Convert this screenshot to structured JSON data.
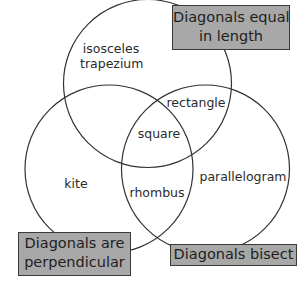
{
  "diagram": {
    "type": "venn",
    "sets": [
      {
        "id": "equal",
        "label_line1": "Diagonals equal",
        "label_line2": "in length",
        "circle": {
          "cx": 147.5,
          "cy": 83.5,
          "r": 84
        }
      },
      {
        "id": "perpendicular",
        "label_line1": "Diagonals are",
        "label_line2": "perpendicular",
        "circle": {
          "cx": 109,
          "cy": 169,
          "r": 84
        }
      },
      {
        "id": "bisect",
        "label": "Diagonals bisect",
        "circle": {
          "cx": 205.5,
          "cy": 169,
          "r": 84
        }
      }
    ],
    "regions": {
      "equal_only_line1": "isosceles",
      "equal_only_line2": "trapezium",
      "equal_and_bisect": "rectangle",
      "all_three": "square",
      "perpendicular_only": "kite",
      "perpendicular_and_bisect": "rhombus",
      "bisect_only": "parallelogram"
    },
    "colors": {
      "stroke": "#333333",
      "box_fill": "#a8a8a8",
      "box_border": "#3a3a3a",
      "background": "#ffffff"
    }
  }
}
